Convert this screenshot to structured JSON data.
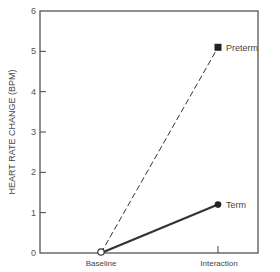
{
  "chart_data": {
    "type": "line",
    "title": "",
    "xlabel": "",
    "ylabel": "HEART RATE CHANGE (BPM)",
    "categories": [
      "Baseline",
      "Interaction"
    ],
    "series": [
      {
        "name": "Preterm",
        "values": [
          0,
          5.1
        ],
        "line_style": "dashed",
        "marker": "square-filled"
      },
      {
        "name": "Term",
        "values": [
          0,
          1.2
        ],
        "line_style": "solid",
        "marker": "circle-filled"
      }
    ],
    "shared_origin_marker": "circle-open",
    "ylim": [
      0,
      6
    ],
    "yticks": [
      0,
      1,
      2,
      3,
      4,
      5,
      6
    ],
    "grid": false,
    "legend": "inline labels at series endpoints",
    "colors": {
      "ink": "#333333",
      "frame": "#555555"
    }
  }
}
